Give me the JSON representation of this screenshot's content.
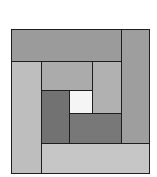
{
  "diagram": {
    "type": "log-cabin-quilt-block",
    "origin": [
      11,
      29
    ],
    "pieces": [
      {
        "name": "top-strip",
        "x": 11,
        "y": 29,
        "w": 111,
        "h": 33,
        "color": "#9b9b9b"
      },
      {
        "name": "right-strip",
        "x": 121,
        "y": 29,
        "w": 29,
        "h": 115,
        "color": "#9e9e9e"
      },
      {
        "name": "left-strip",
        "x": 11,
        "y": 61,
        "w": 31,
        "h": 113,
        "color": "#bebebe"
      },
      {
        "name": "bottom-strip",
        "x": 41,
        "y": 143,
        "w": 109,
        "h": 31,
        "color": "#c6c6c6"
      },
      {
        "name": "inner-top-strip",
        "x": 41,
        "y": 61,
        "w": 52,
        "h": 30,
        "color": "#ababab"
      },
      {
        "name": "inner-right-strip",
        "x": 92,
        "y": 61,
        "w": 30,
        "h": 53,
        "color": "#b1b1b1"
      },
      {
        "name": "inner-left-strip",
        "x": 41,
        "y": 90,
        "w": 29,
        "h": 54,
        "color": "#727272"
      },
      {
        "name": "inner-bottom-strip",
        "x": 69,
        "y": 113,
        "w": 53,
        "h": 31,
        "color": "#787878"
      },
      {
        "name": "center-square",
        "x": 69,
        "y": 90,
        "w": 24,
        "h": 24,
        "color": "#f5f5f5"
      }
    ],
    "outline_color": "#1e1e1e"
  }
}
